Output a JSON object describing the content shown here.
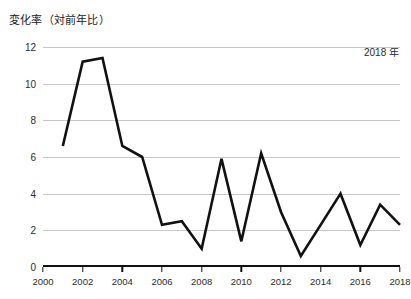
{
  "chart_data": {
    "type": "line",
    "title": "変化率（対前年比）",
    "annotation": "2018 年",
    "xlabel": "",
    "ylabel": "",
    "xlim": [
      2000,
      2018
    ],
    "ylim": [
      0,
      12
    ],
    "grid": true,
    "legend_position": "none",
    "line_color": "#111111",
    "grid_color": "#c9c9c9",
    "axis_color": "#111111",
    "x_tick_labels": [
      "2000",
      "2002",
      "2004",
      "2006",
      "2008",
      "2010",
      "2012",
      "2014",
      "2016",
      "2018"
    ],
    "x_tick_values": [
      2000,
      2002,
      2004,
      2006,
      2008,
      2010,
      2012,
      2014,
      2016,
      2018
    ],
    "y_tick_labels": [
      "0",
      "2",
      "4",
      "6",
      "8",
      "10",
      "12"
    ],
    "y_tick_values": [
      0,
      2,
      4,
      6,
      8,
      10,
      12
    ],
    "x": [
      2001,
      2002,
      2003,
      2004,
      2005,
      2006,
      2007,
      2008,
      2009,
      2010,
      2011,
      2012,
      2013,
      2014,
      2015,
      2016,
      2017,
      2018
    ],
    "values": [
      6.6,
      11.2,
      11.4,
      6.6,
      6.0,
      2.3,
      2.5,
      1.0,
      5.9,
      1.4,
      6.2,
      3.0,
      0.6,
      2.3,
      4.0,
      1.2,
      3.4,
      2.3
    ],
    "series": [
      {
        "name": "変化率（対前年比）",
        "values": [
          6.6,
          11.2,
          11.4,
          6.6,
          6.0,
          2.3,
          2.5,
          1.0,
          5.9,
          1.4,
          6.2,
          3.0,
          0.6,
          2.3,
          4.0,
          1.2,
          3.4,
          2.3
        ]
      }
    ]
  }
}
